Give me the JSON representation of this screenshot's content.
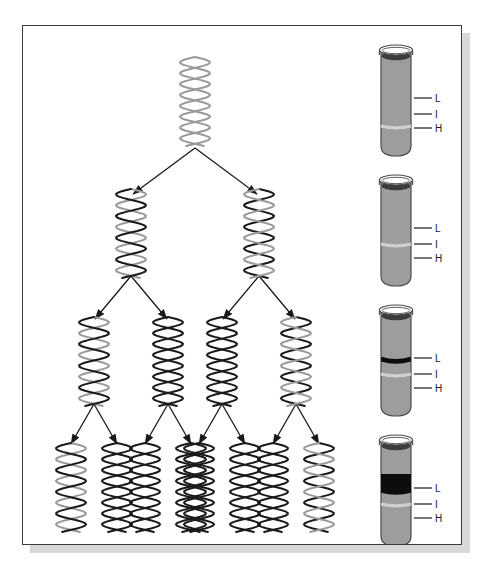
{
  "figure": {
    "generations": [
      {
        "generation_label": "Parental",
        "molecules": [
          {
            "left_strand": "light",
            "right_strand": "light"
          }
        ]
      },
      {
        "generation_label": "Generation 1",
        "molecules": [
          {
            "left_strand": "light",
            "right_strand": "heavy"
          },
          {
            "left_strand": "heavy",
            "right_strand": "light"
          }
        ]
      },
      {
        "generation_label": "Generation 2",
        "molecules": [
          {
            "left_strand": "light",
            "right_strand": "heavy"
          },
          {
            "left_strand": "heavy",
            "right_strand": "heavy"
          },
          {
            "left_strand": "heavy",
            "right_strand": "heavy"
          },
          {
            "left_strand": "heavy",
            "right_strand": "light"
          }
        ]
      },
      {
        "generation_label": "Generation 3",
        "molecules": [
          {
            "left_strand": "light",
            "right_strand": "heavy"
          },
          {
            "left_strand": "heavy",
            "right_strand": "heavy"
          },
          {
            "left_strand": "heavy",
            "right_strand": "heavy"
          },
          {
            "left_strand": "heavy",
            "right_strand": "heavy"
          },
          {
            "left_strand": "heavy",
            "right_strand": "heavy"
          },
          {
            "left_strand": "heavy",
            "right_strand": "heavy"
          },
          {
            "left_strand": "heavy",
            "right_strand": "heavy"
          },
          {
            "left_strand": "heavy",
            "right_strand": "light"
          }
        ]
      }
    ],
    "strand_colors": {
      "light": "#9a9a9a",
      "heavy": "#1a1a1a"
    },
    "arrow_color": "#1a1a1a",
    "frame_color": "#3a3a3a",
    "shadow_color": "#d8d8d8"
  },
  "band_labels": {
    "light": "L",
    "intermediate": "I",
    "heavy": "H"
  },
  "tubes": [
    {
      "tube_index": 1,
      "corresponds_to": "Parental",
      "bands": [
        {
          "position": "L",
          "intensity": "none"
        },
        {
          "position": "I",
          "intensity": "none"
        },
        {
          "position": "H",
          "intensity": "faint"
        }
      ],
      "labels": [
        "L",
        "I",
        "H"
      ]
    },
    {
      "tube_index": 2,
      "corresponds_to": "Generation 1",
      "bands": [
        {
          "position": "L",
          "intensity": "none"
        },
        {
          "position": "I",
          "intensity": "faint"
        },
        {
          "position": "H",
          "intensity": "none"
        }
      ],
      "labels": [
        "L",
        "I",
        "H"
      ]
    },
    {
      "tube_index": 3,
      "corresponds_to": "Generation 2",
      "bands": [
        {
          "position": "L",
          "intensity": "dark"
        },
        {
          "position": "I",
          "intensity": "faint"
        },
        {
          "position": "H",
          "intensity": "none"
        }
      ],
      "labels": [
        "L",
        "I",
        "H"
      ]
    },
    {
      "tube_index": 4,
      "corresponds_to": "Generation 3",
      "bands": [
        {
          "position": "L",
          "intensity": "very-dark-thick"
        },
        {
          "position": "I",
          "intensity": "faint"
        },
        {
          "position": "H",
          "intensity": "none"
        }
      ],
      "labels": [
        "L",
        "I",
        "H"
      ]
    }
  ],
  "tube_style": {
    "body_fill": "#9d9d9d",
    "meniscus_fill": "#3c3c3c",
    "rim_stroke": "#4a4a4a",
    "band_dark": "#0d0d0d",
    "band_faint": "#cfcfcf",
    "leader_color": "#2a2a2a"
  }
}
